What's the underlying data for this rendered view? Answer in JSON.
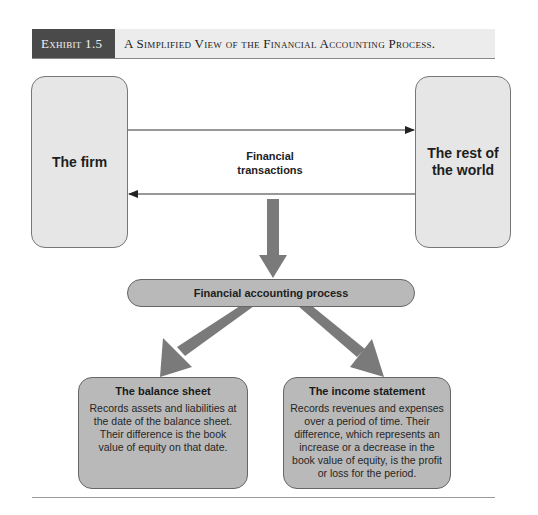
{
  "header": {
    "exhibit_label": "Exhibit 1.5",
    "title": "A Simplified View of the Financial Accounting Process."
  },
  "diagram": {
    "nodes": {
      "firm": "The firm",
      "rest_of_world": "The rest of the world",
      "transactions_label": "Financial transactions",
      "process": "Financial accounting process",
      "balance_sheet": {
        "title": "The balance sheet",
        "description": "Records assets and liabilities at the date of the balance sheet. Their difference is the book value of equity on that date."
      },
      "income_statement": {
        "title": "The income statement",
        "description": "Records revenues and expenses over a period of time. Their difference, which represents an increase or a decrease in the book value of equity, is the profit or loss for the period."
      }
    },
    "edges": [
      {
        "from": "The firm",
        "to": "The rest of the world"
      },
      {
        "from": "The rest of the world",
        "to": "The firm"
      },
      {
        "from": "Financial transactions",
        "to": "Financial accounting process"
      },
      {
        "from": "Financial accounting process",
        "to": "The balance sheet"
      },
      {
        "from": "Financial accounting process",
        "to": "The income statement"
      }
    ],
    "colors": {
      "header_dark": "#4a4a4a",
      "header_light": "#ececec",
      "box_light": "#e6e6e6",
      "box_mid": "#b9b9b9",
      "arrow_fill": "#777777",
      "line": "#333333"
    }
  }
}
